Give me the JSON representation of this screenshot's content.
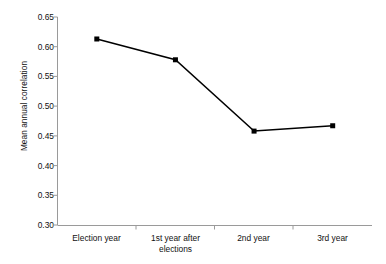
{
  "chart_data": {
    "type": "line",
    "title": "",
    "subtitle": "",
    "xlabel": "",
    "ylabel": "Mean annual correlation",
    "categories": [
      "Election year",
      "1st year after elections",
      "2nd year",
      "3rd year"
    ],
    "category_lines": [
      [
        "Election year"
      ],
      [
        "1st year after",
        "elections"
      ],
      [
        "2nd year"
      ],
      [
        "3rd year"
      ]
    ],
    "series": [
      {
        "name": "Mean annual correlation",
        "values": [
          0.613,
          0.578,
          0.458,
          0.467
        ],
        "color": "#000000",
        "marker": "filled-square",
        "line_width": 1.4
      }
    ],
    "ylim": [
      0.3,
      0.65
    ],
    "yticks": [
      0.3,
      0.35,
      0.4,
      0.45,
      0.5,
      0.55,
      0.6,
      0.65
    ],
    "ytick_labels": [
      "0.30",
      "0.35",
      "0.40",
      "0.45",
      "0.50",
      "0.55",
      "0.60",
      "0.65"
    ],
    "xlim": [
      0,
      4
    ],
    "grid": false,
    "legend": false,
    "legend_position": "none",
    "background_color": "#ffffff",
    "axis_color": "#9a9a9a"
  }
}
